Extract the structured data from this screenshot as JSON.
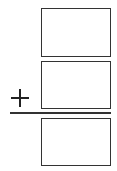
{
  "problem": {
    "operator": "+",
    "operator_icon": "plus-icon",
    "addend_top": "",
    "addend_bottom": "",
    "sum": ""
  },
  "colors": {
    "stroke": "#333333",
    "background": "#ffffff"
  }
}
